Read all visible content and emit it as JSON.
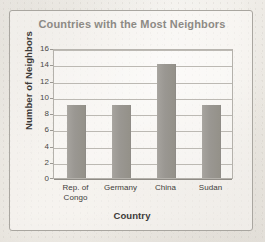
{
  "figure": {
    "title": "Countries with the Most Neighbors"
  },
  "chart_data": {
    "type": "bar",
    "title": "Countries with the Most Neighbors",
    "xlabel": "Country",
    "ylabel": "Number of Neighbors",
    "categories": [
      "Rep. of Congo",
      "Germany",
      "China",
      "Sudan"
    ],
    "category_lines": [
      [
        "Rep. of",
        "Congo"
      ],
      [
        "Germany"
      ],
      [
        "China"
      ],
      [
        "Sudan"
      ]
    ],
    "values": [
      9,
      9,
      14,
      9
    ],
    "ylim": [
      0,
      16
    ],
    "ytick_step": 2,
    "yticks": [
      16,
      14,
      12,
      10,
      8,
      6,
      4,
      2,
      0
    ],
    "grid": "horizontal",
    "legend": "none",
    "bar_color": "#9a9792",
    "title_color": "#8d8a85",
    "axis_label_color": "#3c3a38",
    "gridline_color": "#bcb9b3"
  }
}
